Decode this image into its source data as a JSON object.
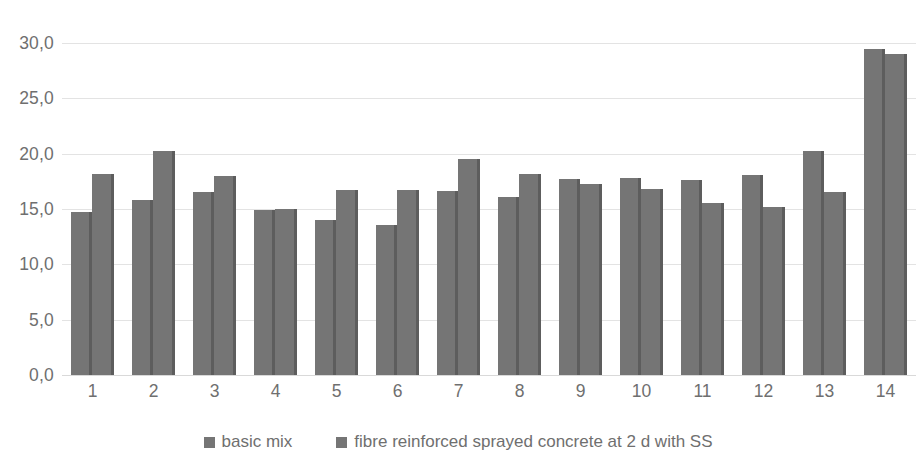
{
  "chart_data": {
    "type": "bar",
    "title": "",
    "xlabel": "",
    "ylabel": "",
    "categories": [
      "1",
      "2",
      "3",
      "4",
      "5",
      "6",
      "7",
      "8",
      "9",
      "10",
      "11",
      "12",
      "13",
      "14"
    ],
    "series": [
      {
        "name": "basic mix",
        "values": [
          14.7,
          15.8,
          16.5,
          14.9,
          14.0,
          13.6,
          16.6,
          16.1,
          17.7,
          17.8,
          17.6,
          18.1,
          20.2,
          29.5
        ]
      },
      {
        "name": "fibre reinforced sprayed concrete at 2 d with SS",
        "values": [
          18.2,
          20.2,
          18.0,
          15.0,
          16.7,
          16.7,
          19.5,
          18.2,
          17.3,
          16.8,
          15.5,
          15.2,
          16.5,
          29.0
        ]
      }
    ],
    "ylim": [
      0,
      30
    ],
    "ytick_values": [
      0,
      5,
      10,
      15,
      20,
      25,
      30
    ],
    "ytick_labels": [
      "0,0",
      "5,0",
      "10,0",
      "15,0",
      "20,0",
      "25,0",
      "30,0"
    ],
    "grid": true,
    "legend_position": "bottom",
    "bar_color": "#757575",
    "gridline_color": "#e3e3e3",
    "text_color": "#6f6f6f"
  }
}
